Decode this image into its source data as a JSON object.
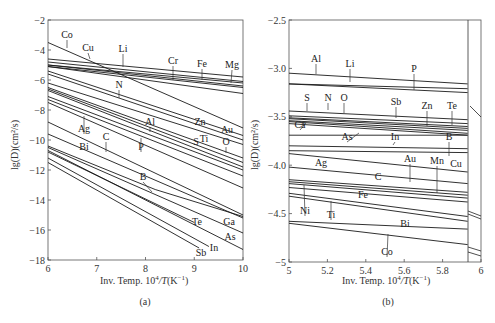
{
  "chart_data": [
    {
      "type": "line",
      "panel": "(a)",
      "title": "",
      "xlabel": "Inv. Temp. 10^4/T(K^-1)",
      "ylabel": "lg(D)(cm^2/s)",
      "xlim": [
        6,
        10
      ],
      "ylim": [
        -18,
        -2
      ],
      "xticks": [
        "6",
        "7",
        "8",
        "9",
        "10"
      ],
      "yticks": [
        "-2",
        "-4",
        "-6",
        "-8",
        "-10",
        "-12",
        "-14",
        "-16",
        "-18"
      ],
      "grid": false,
      "legend": "inline labels",
      "series": [
        {
          "name": "Co",
          "x": [
            6,
            10
          ],
          "y": [
            -3.5,
            -9.2
          ]
        },
        {
          "name": "Mg",
          "x": [
            6,
            10
          ],
          "y": [
            -4.6,
            -5.8
          ]
        },
        {
          "name": "Li",
          "x": [
            6,
            10
          ],
          "y": [
            -4.8,
            -6.1
          ]
        },
        {
          "name": "Fe",
          "x": [
            6,
            10
          ],
          "y": [
            -5.0,
            -6.2
          ]
        },
        {
          "name": "Cr",
          "x": [
            6,
            10
          ],
          "y": [
            -5.0,
            -6.4
          ]
        },
        {
          "name": "Cu",
          "x": [
            6,
            10
          ],
          "y": [
            -5.1,
            -6.5
          ]
        },
        {
          "name": "",
          "x": [
            6,
            10
          ],
          "y": [
            -5.1,
            -6.9
          ]
        },
        {
          "name": "Au",
          "x": [
            6,
            10
          ],
          "y": [
            -5.4,
            -9.7
          ]
        },
        {
          "name": "Zn",
          "x": [
            6,
            10
          ],
          "y": [
            -5.6,
            -10.0
          ]
        },
        {
          "name": "N",
          "x": [
            6,
            10
          ],
          "y": [
            -6.2,
            -10.3
          ]
        },
        {
          "name": "O",
          "x": [
            6,
            10
          ],
          "y": [
            -6.5,
            -11.2
          ]
        },
        {
          "name": "Ti",
          "x": [
            6,
            10
          ],
          "y": [
            -6.6,
            -11.5
          ]
        },
        {
          "name": "S",
          "x": [
            6,
            10
          ],
          "y": [
            -6.7,
            -11.8
          ]
        },
        {
          "name": "Al",
          "x": [
            6,
            10
          ],
          "y": [
            -7.1,
            -12.0
          ]
        },
        {
          "name": "Ag",
          "x": [
            6,
            10
          ],
          "y": [
            -7.3,
            -12.4
          ]
        },
        {
          "name": "P",
          "x": [
            6,
            10
          ],
          "y": [
            -7.5,
            -13.2
          ]
        },
        {
          "name": "C",
          "x": [
            6,
            10
          ],
          "y": [
            -8.8,
            -15.0
          ]
        },
        {
          "name": "Bi",
          "x": [
            6,
            10
          ],
          "y": [
            -9.6,
            -15.2
          ]
        },
        {
          "name": "B",
          "x": [
            6,
            8.2,
            10
          ],
          "y": [
            -10.4,
            -13.3,
            -15.1
          ]
        },
        {
          "name": "Ga",
          "x": [
            6,
            10
          ],
          "y": [
            -10.5,
            -16.2
          ]
        },
        {
          "name": "As",
          "x": [
            6,
            10
          ],
          "y": [
            -10.7,
            -17.3
          ]
        },
        {
          "name": "Te",
          "x": [
            6,
            9.0
          ],
          "y": [
            -10.8,
            -15.5
          ]
        },
        {
          "name": "In",
          "x": [
            6,
            9.3
          ],
          "y": [
            -11.2,
            -17.1
          ]
        },
        {
          "name": "Sb",
          "x": [
            6,
            9.1
          ],
          "y": [
            -11.5,
            -17.2
          ]
        }
      ],
      "annotations": [
        "Co",
        "Cu",
        "Li",
        "Cr",
        "Fe",
        "Mg",
        "N",
        "Al",
        "Zn",
        "Au",
        "Ag",
        "C",
        "P",
        "S",
        "Ti",
        "O",
        "Bi",
        "B",
        "Te",
        "Ga",
        "As",
        "In",
        "Sb"
      ]
    },
    {
      "type": "line",
      "panel": "(b)",
      "title": "",
      "xlabel": "Inv. Temp. 10^4/T(K^-1)",
      "ylabel": "lg(D)(cm^2/s)",
      "xlim": [
        5,
        6
      ],
      "ylim": [
        -5,
        -2.5
      ],
      "xticks": [
        "5",
        "5.2",
        "5.4",
        "5.6",
        "5.8",
        "6"
      ],
      "yticks": [
        "-2.5",
        "-3.0",
        "-3.5",
        "-4.0",
        "-4.5",
        "-5"
      ],
      "grid": false,
      "legend": "inline labels",
      "axis_break_x": 5.93,
      "series": [
        {
          "name": "Al",
          "x": [
            5,
            5.93
          ],
          "y": [
            -3.05,
            -3.16
          ]
        },
        {
          "name": "Li",
          "x": [
            5,
            5.93
          ],
          "y": [
            -3.16,
            -3.21
          ]
        },
        {
          "name": "P",
          "x": [
            5,
            5.93
          ],
          "y": [
            -3.16,
            -3.25
          ]
        },
        {
          "name": "S",
          "x": [
            5,
            5.93
          ],
          "y": [
            -3.44,
            -3.53
          ]
        },
        {
          "name": "N",
          "x": [
            5,
            5.93
          ],
          "y": [
            -3.49,
            -3.57
          ]
        },
        {
          "name": "O",
          "x": [
            5,
            5.93
          ],
          "y": [
            -3.51,
            -3.6
          ]
        },
        {
          "name": "Sb",
          "x": [
            5,
            5.93
          ],
          "y": [
            -3.52,
            -3.62
          ]
        },
        {
          "name": "Zn",
          "x": [
            5,
            5.93
          ],
          "y": [
            -3.54,
            -3.64
          ]
        },
        {
          "name": "Te",
          "x": [
            5,
            5.93
          ],
          "y": [
            -3.55,
            -3.67
          ]
        },
        {
          "name": "Ca",
          "x": [
            5,
            5.93
          ],
          "y": [
            -3.57,
            -3.69
          ]
        },
        {
          "name": "As",
          "x": [
            5,
            5.93
          ],
          "y": [
            -3.69,
            -3.69
          ]
        },
        {
          "name": "In",
          "x": [
            5,
            5.93
          ],
          "y": [
            -3.8,
            -3.83
          ]
        },
        {
          "name": "B",
          "x": [
            5,
            5.93
          ],
          "y": [
            -3.85,
            -3.87
          ]
        },
        {
          "name": "Cu",
          "x": [
            5,
            5.93
          ],
          "y": [
            -3.88,
            -4.07
          ]
        },
        {
          "name": "Ag",
          "x": [
            5,
            5.93
          ],
          "y": [
            -4.02,
            -4.19
          ]
        },
        {
          "name": "Au",
          "x": [
            5,
            5.93
          ],
          "y": [
            -4.15,
            -4.28
          ]
        },
        {
          "name": "C",
          "x": [
            5,
            5.93
          ],
          "y": [
            -4.17,
            -4.31
          ]
        },
        {
          "name": "Mn",
          "x": [
            5,
            5.93
          ],
          "y": [
            -4.19,
            -4.34
          ]
        },
        {
          "name": "Fe",
          "x": [
            5,
            5.93
          ],
          "y": [
            -4.23,
            -4.38
          ]
        },
        {
          "name": "Ni",
          "x": [
            5,
            5.93
          ],
          "y": [
            -4.29,
            -4.53
          ]
        },
        {
          "name": "Ti",
          "x": [
            5,
            5.93
          ],
          "y": [
            -4.32,
            -4.58
          ]
        },
        {
          "name": "Bi",
          "x": [
            5,
            5.93
          ],
          "y": [
            -4.58,
            -4.66
          ]
        },
        {
          "name": "Co",
          "x": [
            5,
            5.93
          ],
          "y": [
            -4.6,
            -4.82
          ]
        }
      ],
      "annotations": [
        "Al",
        "Li",
        "P",
        "S",
        "N",
        "O",
        "Sb",
        "Zn",
        "Te",
        "Ca",
        "As",
        "In",
        "B",
        "Ag",
        "Cu",
        "Au",
        "Mn",
        "C",
        "Fe",
        "Ni",
        "Ti",
        "Bi",
        "Co"
      ]
    }
  ],
  "panels": {
    "a": {
      "caption": "(a)",
      "xlabel": "Inv. Temp. 10",
      "xlabel_sup": "4",
      "xlabel_tail": "/T(K",
      "xlabel_sup2": "−1",
      "xlabel_end": ")",
      "ylabel": "lg(D)(cm²/s)",
      "yticks": [
        "−2",
        "−4",
        "−6",
        "−8",
        "−10",
        "−12",
        "−14",
        "−16",
        "−18"
      ],
      "xticks": [
        "6",
        "7",
        "8",
        "9",
        "10"
      ]
    },
    "b": {
      "caption": "(b)",
      "xlabel": "Inv. Temp. 10",
      "xlabel_sup": "4",
      "xlabel_tail": "/T(K",
      "xlabel_sup2": "−1",
      "xlabel_end": ")",
      "ylabel": "lg(D)(cm²/s)",
      "yticks": [
        "−2.5",
        "−3.0",
        "−3.5",
        "−4.0",
        "−4.5",
        "−5"
      ],
      "xticks": [
        "5",
        "5.2",
        "5.4",
        "5.6",
        "5.8",
        "6"
      ]
    }
  }
}
